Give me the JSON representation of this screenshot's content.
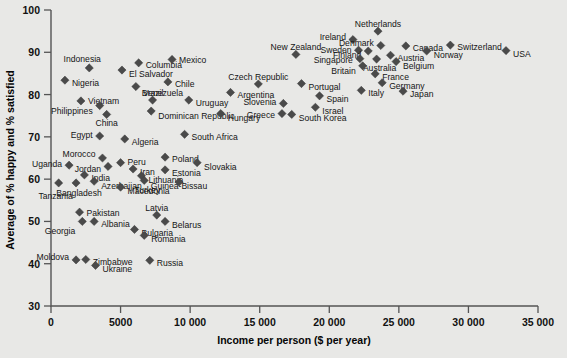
{
  "chart_data": {
    "type": "scatter",
    "title": "",
    "xlabel": "Income per person ($ per year)",
    "ylabel": "Average of % happy and % satisfied",
    "xlim": [
      0,
      35000
    ],
    "ylim": [
      30,
      100
    ],
    "xticks": [
      0,
      5000,
      10000,
      15000,
      20000,
      25000,
      30000,
      35000
    ],
    "xticklabels": [
      "0",
      "5000",
      "10 000",
      "15 000",
      "20 000",
      "25 000",
      "30 000",
      "35 000"
    ],
    "yticks": [
      30,
      40,
      50,
      60,
      70,
      80,
      90,
      100
    ],
    "yticklabels": [
      "30",
      "40",
      "50",
      "60",
      "70",
      "80",
      "90",
      "100"
    ],
    "grid": false,
    "legend": null,
    "marker_shape": "diamond",
    "marker_color": "#4a4a4a",
    "points": [
      {
        "label": "Indonesia",
        "x": 2750,
        "y": 86.3,
        "lx": -7,
        "ly": -9,
        "anchor": "middle"
      },
      {
        "label": "Columbia",
        "x": 6300,
        "y": 87.5,
        "lx": 7,
        "ly": 2,
        "anchor": "start"
      },
      {
        "label": "Mexico",
        "x": 8700,
        "y": 88.3,
        "lx": 7,
        "ly": 1,
        "anchor": "start"
      },
      {
        "label": "El Salvador",
        "x": 5100,
        "y": 85.8,
        "lx": 7,
        "ly": 4,
        "anchor": "start"
      },
      {
        "label": "Nigeria",
        "x": 1000,
        "y": 83.4,
        "lx": 7,
        "ly": 3,
        "anchor": "start"
      },
      {
        "label": "Chile",
        "x": 8400,
        "y": 83.0,
        "lx": 7,
        "ly": 2,
        "anchor": "start"
      },
      {
        "label": "Venezuela",
        "x": 6100,
        "y": 81.9,
        "lx": 7,
        "ly": 6,
        "anchor": "start"
      },
      {
        "label": "Vietnam",
        "x": 2150,
        "y": 78.5,
        "lx": 7,
        "ly": 0,
        "anchor": "start"
      },
      {
        "label": "Brazil",
        "x": 7300,
        "y": 78.7,
        "lx": 0,
        "ly": -7,
        "anchor": "middle"
      },
      {
        "label": "Uruguay",
        "x": 9900,
        "y": 78.7,
        "lx": 7,
        "ly": 3,
        "anchor": "start"
      },
      {
        "label": "Philippines",
        "x": 3500,
        "y": 77.4,
        "lx": -7,
        "ly": 5,
        "anchor": "end"
      },
      {
        "label": "Dominican Republic",
        "x": 7200,
        "y": 76.1,
        "lx": 7,
        "ly": 5,
        "anchor": "start"
      },
      {
        "label": "China",
        "x": 4000,
        "y": 75.3,
        "lx": 0,
        "ly": 9,
        "anchor": "middle"
      },
      {
        "label": "Egypt",
        "x": 3500,
        "y": 70.2,
        "lx": -7,
        "ly": -1,
        "anchor": "end"
      },
      {
        "label": "Algeria",
        "x": 5300,
        "y": 69.5,
        "lx": 7,
        "ly": 3,
        "anchor": "start"
      },
      {
        "label": "South Africa",
        "x": 9600,
        "y": 70.6,
        "lx": 7,
        "ly": 3,
        "anchor": "start"
      },
      {
        "label": "Morocco",
        "x": 3700,
        "y": 65.0,
        "lx": -7,
        "ly": -4,
        "anchor": "end"
      },
      {
        "label": "Uganda",
        "x": 1300,
        "y": 63.3,
        "lx": -7,
        "ly": -1,
        "anchor": "end"
      },
      {
        "label": "Jordan",
        "x": 4100,
        "y": 63.0,
        "lx": -7,
        "ly": 3,
        "anchor": "end"
      },
      {
        "label": "Peru",
        "x": 5000,
        "y": 63.9,
        "lx": 7,
        "ly": -1,
        "anchor": "start"
      },
      {
        "label": "Poland",
        "x": 8200,
        "y": 65.2,
        "lx": 7,
        "ly": 2,
        "anchor": "start"
      },
      {
        "label": "Slovakia",
        "x": 10500,
        "y": 63.9,
        "lx": 7,
        "ly": 4,
        "anchor": "start"
      },
      {
        "label": "Iran",
        "x": 5900,
        "y": 62.4,
        "lx": 7,
        "ly": 3,
        "anchor": "start"
      },
      {
        "label": "Estonia",
        "x": 8200,
        "y": 62.2,
        "lx": 7,
        "ly": 3,
        "anchor": "start"
      },
      {
        "label": "India",
        "x": 2400,
        "y": 61.0,
        "lx": 7,
        "ly": 3,
        "anchor": "start"
      },
      {
        "label": "Lithuania",
        "x": 6500,
        "y": 60.8,
        "lx": 7,
        "ly": 4,
        "anchor": "start"
      },
      {
        "label": "Azerbaijan",
        "x": 3100,
        "y": 59.5,
        "lx": 7,
        "ly": 5,
        "anchor": "start"
      },
      {
        "label": "Turkey",
        "x": 6700,
        "y": 59.7,
        "lx": 3,
        "ly": 10,
        "anchor": "middle"
      },
      {
        "label": "Guinea-Bissau",
        "x": 9200,
        "y": 59.3,
        "lx": 0,
        "ly": 4,
        "anchor": "middle"
      },
      {
        "label": "Bangladesh",
        "x": 1800,
        "y": 59.1,
        "lx": 3,
        "ly": 10,
        "anchor": "middle"
      },
      {
        "label": "Tanzania",
        "x": 550,
        "y": 59.1,
        "lx": -3,
        "ly": 13,
        "anchor": "middle"
      },
      {
        "label": "Macedonia",
        "x": 5000,
        "y": 58.1,
        "lx": 7,
        "ly": 4,
        "anchor": "start"
      },
      {
        "label": "Pakistan",
        "x": 2050,
        "y": 52.2,
        "lx": 7,
        "ly": 1,
        "anchor": "start"
      },
      {
        "label": "Latvia",
        "x": 7600,
        "y": 51.5,
        "lx": 0,
        "ly": -7,
        "anchor": "middle"
      },
      {
        "label": "Albania",
        "x": 3100,
        "y": 50.0,
        "lx": 7,
        "ly": 3,
        "anchor": "start"
      },
      {
        "label": "Belarus",
        "x": 8200,
        "y": 50.0,
        "lx": 7,
        "ly": 4,
        "anchor": "start"
      },
      {
        "label": "Georgia",
        "x": 2250,
        "y": 50.0,
        "lx": -7,
        "ly": 10,
        "anchor": "end"
      },
      {
        "label": "Bulgaria",
        "x": 6000,
        "y": 48.1,
        "lx": 7,
        "ly": 4,
        "anchor": "start"
      },
      {
        "label": "Romania",
        "x": 6700,
        "y": 46.7,
        "lx": 7,
        "ly": 4,
        "anchor": "start"
      },
      {
        "label": "Moldova",
        "x": 1800,
        "y": 40.9,
        "lx": -7,
        "ly": -3,
        "anchor": "end"
      },
      {
        "label": "Zimbabwe",
        "x": 2500,
        "y": 41.0,
        "lx": 7,
        "ly": 3,
        "anchor": "start"
      },
      {
        "label": "Ukraine",
        "x": 3200,
        "y": 39.6,
        "lx": 7,
        "ly": 4,
        "anchor": "start"
      },
      {
        "label": "Russia",
        "x": 7100,
        "y": 40.8,
        "lx": 7,
        "ly": 3,
        "anchor": "start"
      },
      {
        "label": "New Zealand",
        "x": 17600,
        "y": 89.5,
        "lx": 0,
        "ly": -7,
        "anchor": "middle"
      },
      {
        "label": "Ireland",
        "x": 21700,
        "y": 93.0,
        "lx": -7,
        "ly": -3,
        "anchor": "end"
      },
      {
        "label": "Netherlands",
        "x": 23500,
        "y": 95.0,
        "lx": 0,
        "ly": -7,
        "anchor": "middle"
      },
      {
        "label": "Denmark",
        "x": 23700,
        "y": 91.6,
        "lx": -7,
        "ly": -3,
        "anchor": "end"
      },
      {
        "label": "Canada",
        "x": 25500,
        "y": 91.5,
        "lx": 7,
        "ly": 2,
        "anchor": "start"
      },
      {
        "label": "Switzerland",
        "x": 28700,
        "y": 91.7,
        "lx": 7,
        "ly": 2,
        "anchor": "start"
      },
      {
        "label": "Sweden",
        "x": 22100,
        "y": 90.5,
        "lx": -7,
        "ly": 0,
        "anchor": "end"
      },
      {
        "label": "Finland",
        "x": 22800,
        "y": 90.3,
        "lx": -7,
        "ly": 4,
        "anchor": "end"
      },
      {
        "label": "Austria",
        "x": 24400,
        "y": 89.3,
        "lx": 7,
        "ly": 3,
        "anchor": "start"
      },
      {
        "label": "Norway",
        "x": 27000,
        "y": 90.3,
        "lx": 7,
        "ly": 4,
        "anchor": "start"
      },
      {
        "label": "USA",
        "x": 32700,
        "y": 90.4,
        "lx": 7,
        "ly": 3,
        "anchor": "start"
      },
      {
        "label": "Singapore",
        "x": 22200,
        "y": 88.5,
        "lx": -7,
        "ly": 1,
        "anchor": "end"
      },
      {
        "label": "Australia",
        "x": 23400,
        "y": 88.4,
        "lx": 3,
        "ly": 9,
        "anchor": "middle"
      },
      {
        "label": "Belgium",
        "x": 24800,
        "y": 87.8,
        "lx": 7,
        "ly": 4,
        "anchor": "start"
      },
      {
        "label": "Britain",
        "x": 22400,
        "y": 86.8,
        "lx": -7,
        "ly": 5,
        "anchor": "end"
      },
      {
        "label": "France",
        "x": 23300,
        "y": 84.9,
        "lx": 7,
        "ly": 3,
        "anchor": "start"
      },
      {
        "label": "Germany",
        "x": 23800,
        "y": 82.8,
        "lx": 7,
        "ly": 3,
        "anchor": "start"
      },
      {
        "label": "Italy",
        "x": 22300,
        "y": 81.0,
        "lx": 7,
        "ly": 3,
        "anchor": "start"
      },
      {
        "label": "Japan",
        "x": 25300,
        "y": 80.8,
        "lx": 7,
        "ly": 3,
        "anchor": "start"
      },
      {
        "label": "Czech Republic",
        "x": 14900,
        "y": 82.5,
        "lx": 0,
        "ly": -7,
        "anchor": "middle"
      },
      {
        "label": "Portugal",
        "x": 18000,
        "y": 82.6,
        "lx": 7,
        "ly": 3,
        "anchor": "start"
      },
      {
        "label": "Argentina",
        "x": 12900,
        "y": 80.5,
        "lx": 7,
        "ly": 3,
        "anchor": "start"
      },
      {
        "label": "Spain",
        "x": 19300,
        "y": 79.7,
        "lx": 7,
        "ly": 3,
        "anchor": "start"
      },
      {
        "label": "Slovenia",
        "x": 16700,
        "y": 77.9,
        "lx": -7,
        "ly": -1,
        "anchor": "end"
      },
      {
        "label": "Israel",
        "x": 19000,
        "y": 77.0,
        "lx": 7,
        "ly": 4,
        "anchor": "start"
      },
      {
        "label": "Greece",
        "x": 16600,
        "y": 75.5,
        "lx": -7,
        "ly": 1,
        "anchor": "end"
      },
      {
        "label": "South Korea",
        "x": 17300,
        "y": 75.3,
        "lx": 7,
        "ly": 4,
        "anchor": "start"
      },
      {
        "label": "Hungary",
        "x": 12200,
        "y": 75.5,
        "lx": 7,
        "ly": 4,
        "anchor": "start"
      }
    ]
  }
}
